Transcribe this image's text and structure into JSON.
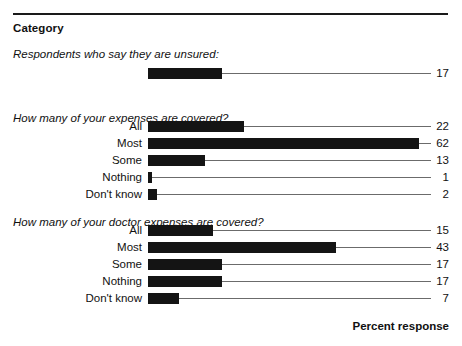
{
  "header": {
    "category_label": "Category",
    "axis_title": "Percent response"
  },
  "chart_data": {
    "type": "bar",
    "orientation": "horizontal",
    "title": "Category",
    "xlabel": "Percent response",
    "ylabel": "",
    "xlim": [
      0,
      65
    ],
    "grid": false,
    "legend": null,
    "value_unit": "percent",
    "sections": [
      {
        "heading": "Respondents who say they are unsured:",
        "categories": [
          ""
        ],
        "values": [
          17
        ]
      },
      {
        "heading": "How many of your expenses are covered?",
        "categories": [
          "All",
          "Most",
          "Some",
          "Nothing",
          "Don't know"
        ],
        "values": [
          22,
          62,
          13,
          1,
          2
        ]
      },
      {
        "heading": "How many of your doctor expenses are covered?",
        "categories": [
          "All",
          "Most",
          "Some",
          "Nothing",
          "Don't know"
        ],
        "values": [
          15,
          43,
          17,
          17,
          7
        ]
      }
    ]
  },
  "style": {
    "bar_color": "#141414",
    "leader_color": "#6b6b6b",
    "rule_color": "#1a1a1a",
    "background": "#ffffff"
  }
}
